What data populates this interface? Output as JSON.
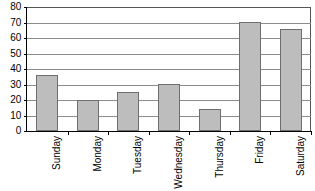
{
  "chart_data": {
    "type": "bar",
    "title": "",
    "xlabel": "",
    "ylabel": "",
    "categories": [
      "Sunday",
      "Monday",
      "Tuesday",
      "Wednesday",
      "Thursday",
      "Friday",
      "Saturday"
    ],
    "values": [
      36,
      20,
      25,
      30,
      14,
      70,
      66
    ],
    "ylim": [
      0,
      80
    ],
    "ytick_step": 10,
    "yticks": [
      0,
      10,
      20,
      30,
      40,
      50,
      60,
      70,
      80
    ],
    "ytick_labels": [
      "0",
      "10",
      "20",
      "30",
      "40",
      "50",
      "60",
      "70",
      "80"
    ],
    "grid": true,
    "grid_axis": "y",
    "legend": null,
    "bar_fill": "#bdbdbd",
    "bar_edge": "#6e6e6e",
    "gridline_color": "#8c8c8c",
    "axis_color": "#000000",
    "background": "#ffffff",
    "xtick_label_rotation": 90
  }
}
